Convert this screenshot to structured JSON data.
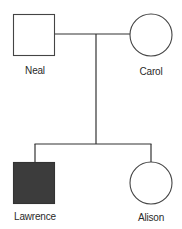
{
  "diagram": {
    "type": "pedigree",
    "colors": {
      "line": "#333333",
      "affected_fill": "#3c3c3c",
      "unaffected_fill": "#ffffff"
    },
    "generations": [
      {
        "level": 1,
        "individuals": [
          {
            "name": "Neal",
            "sex": "male",
            "shape": "square",
            "affected": false
          },
          {
            "name": "Carol",
            "sex": "female",
            "shape": "circle",
            "affected": false
          }
        ]
      },
      {
        "level": 2,
        "individuals": [
          {
            "name": "Lawrence",
            "sex": "male",
            "shape": "square",
            "affected": true
          },
          {
            "name": "Alison",
            "sex": "female",
            "shape": "circle",
            "affected": false
          }
        ]
      }
    ],
    "relationships": [
      {
        "type": "mating",
        "between": [
          "Neal",
          "Carol"
        ]
      },
      {
        "type": "offspring",
        "parents": [
          "Neal",
          "Carol"
        ],
        "children": [
          "Lawrence",
          "Alison"
        ]
      }
    ]
  },
  "labels": {
    "neal": "Neal",
    "carol": "Carol",
    "lawrence": "Lawrence",
    "alison": "Alison"
  }
}
